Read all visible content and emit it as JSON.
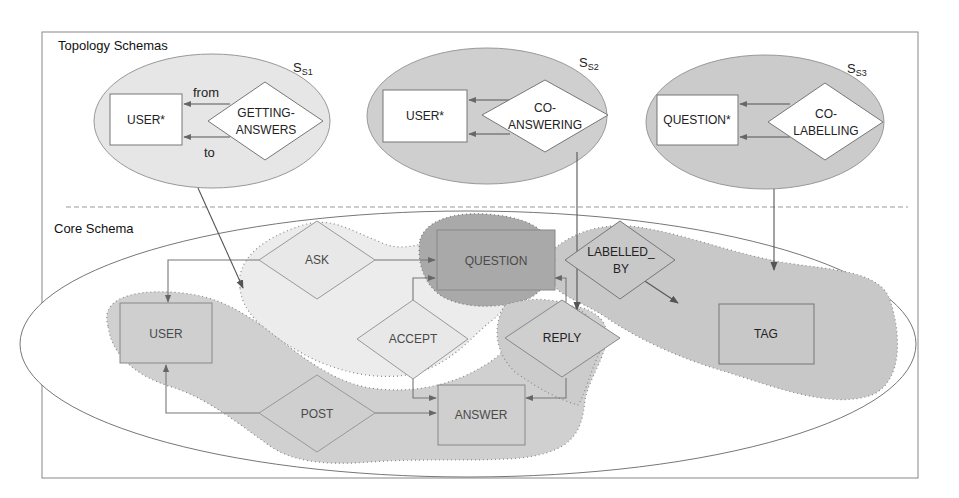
{
  "sections": {
    "topology_title": "Topology Schemas",
    "core_title": "Core Schema"
  },
  "topology_schemas": [
    {
      "id": "S",
      "sub": "S1",
      "entity": "USER*",
      "relation_line1": "GETTING-",
      "relation_line2": "ANSWERS",
      "edge_from": "from",
      "edge_to": "to"
    },
    {
      "id": "S",
      "sub": "S2",
      "entity": "USER*",
      "relation_line1": "CO-",
      "relation_line2": "ANSWERING"
    },
    {
      "id": "S",
      "sub": "S3",
      "entity": "QUESTION*",
      "relation_line1": "CO-",
      "relation_line2": "LABELLING"
    }
  ],
  "core_schema": {
    "entities": {
      "user": "USER",
      "question": "QUESTION",
      "answer": "ANSWER",
      "tag": "TAG"
    },
    "relations": {
      "ask": "ASK",
      "accept": "ACCEPT",
      "reply": "REPLY",
      "post": "POST",
      "labelled_by_line1": "LABELLED_",
      "labelled_by_line2": "BY"
    }
  },
  "colors": {
    "light_region": "#ececec",
    "mid_region": "#c9c9c9",
    "dark_region": "#a8a8a8",
    "topology_light": "#e4e4e4",
    "topology_mid": "#cfcfcf",
    "stroke": "#777777"
  }
}
